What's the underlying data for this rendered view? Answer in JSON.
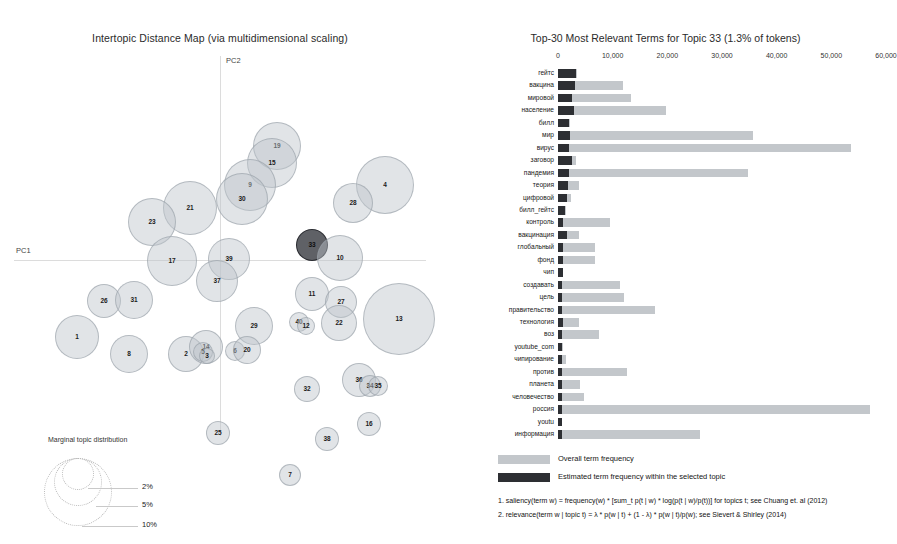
{
  "left": {
    "title": "Intertopic Distance Map (via multidimensional scaling)",
    "axis": {
      "x_label": "PC1",
      "y_label": "PC2"
    },
    "marginal_legend": {
      "title": "Marginal topic distribution",
      "ticks": [
        "2%",
        "5%",
        "10%"
      ]
    },
    "topics": [
      {
        "id": "19",
        "x": 263,
        "y": 90,
        "r": 24
      },
      {
        "id": "15",
        "x": 258,
        "y": 107,
        "r": 25
      },
      {
        "id": "9",
        "x": 236,
        "y": 129,
        "r": 26
      },
      {
        "id": "30",
        "x": 228,
        "y": 143,
        "r": 26
      },
      {
        "id": "4",
        "x": 371,
        "y": 129,
        "r": 29
      },
      {
        "id": "28",
        "x": 339,
        "y": 147,
        "r": 20
      },
      {
        "id": "21",
        "x": 176,
        "y": 152,
        "r": 27
      },
      {
        "id": "23",
        "x": 138,
        "y": 166,
        "r": 24
      },
      {
        "id": "17",
        "x": 158,
        "y": 205,
        "r": 25
      },
      {
        "id": "39",
        "x": 215,
        "y": 203,
        "r": 21
      },
      {
        "id": "37",
        "x": 203,
        "y": 225,
        "r": 21
      },
      {
        "id": "33",
        "x": 298,
        "y": 189,
        "r": 16
      },
      {
        "id": "10",
        "x": 326,
        "y": 202,
        "r": 23
      },
      {
        "id": "11",
        "x": 298,
        "y": 238,
        "r": 17
      },
      {
        "id": "27",
        "x": 327,
        "y": 246,
        "r": 16
      },
      {
        "id": "13",
        "x": 385,
        "y": 263,
        "r": 36
      },
      {
        "id": "26",
        "x": 90,
        "y": 245,
        "r": 17
      },
      {
        "id": "31",
        "x": 120,
        "y": 244,
        "r": 19
      },
      {
        "id": "1",
        "x": 63,
        "y": 281,
        "r": 22
      },
      {
        "id": "8",
        "x": 115,
        "y": 298,
        "r": 19
      },
      {
        "id": "2",
        "x": 172,
        "y": 298,
        "r": 18
      },
      {
        "id": "14",
        "x": 192,
        "y": 291,
        "r": 17
      },
      {
        "id": "5",
        "x": 189,
        "y": 296,
        "r": 10
      },
      {
        "id": "3",
        "x": 193,
        "y": 300,
        "r": 8
      },
      {
        "id": "40",
        "x": 285,
        "y": 266,
        "r": 10
      },
      {
        "id": "12",
        "x": 292,
        "y": 270,
        "r": 9
      },
      {
        "id": "29",
        "x": 240,
        "y": 270,
        "r": 19
      },
      {
        "id": "6",
        "x": 221,
        "y": 295,
        "r": 10
      },
      {
        "id": "20",
        "x": 233,
        "y": 294,
        "r": 14
      },
      {
        "id": "22",
        "x": 325,
        "y": 267,
        "r": 18
      },
      {
        "id": "32",
        "x": 293,
        "y": 333,
        "r": 13
      },
      {
        "id": "36",
        "x": 345,
        "y": 324,
        "r": 17
      },
      {
        "id": "34",
        "x": 356,
        "y": 330,
        "r": 11
      },
      {
        "id": "35",
        "x": 364,
        "y": 330,
        "r": 10
      },
      {
        "id": "16",
        "x": 355,
        "y": 368,
        "r": 12
      },
      {
        "id": "38",
        "x": 313,
        "y": 383,
        "r": 12
      },
      {
        "id": "25",
        "x": 204,
        "y": 377,
        "r": 12
      },
      {
        "id": "7",
        "x": 276,
        "y": 419,
        "r": 11
      },
      {
        "id": "18",
        "x": 355,
        "y": 368,
        "r": 0
      }
    ],
    "selected_topic": "33"
  },
  "right": {
    "title": "Top-30 Most Relevant Terms for Topic 33 (1.3% of tokens)",
    "legend": {
      "overall": "Overall term frequency",
      "topic": "Estimated term frequency within the selected topic"
    },
    "footnotes": [
      "1. saliency(term w) = frequency(w) * [sum_t p(t | w) * log(p(t | w)/p(t))] for topics t; see Chuang et. al (2012)",
      "2. relevance(term w | topic t) = λ * p(w | t) + (1 - λ) * p(w | t)/p(w); see Sievert & Shirley (2014)"
    ]
  },
  "chart_data": {
    "type": "bar",
    "title": "Top-30 Most Relevant Terms for Topic 33 (1.3% of tokens)",
    "orientation": "horizontal",
    "xlabel": "",
    "ylabel": "",
    "xlim": [
      0,
      60000
    ],
    "xticks": [
      0,
      10000,
      20000,
      30000,
      40000,
      50000,
      60000
    ],
    "xtick_labels": [
      "0",
      "10,000",
      "20,000",
      "30,000",
      "40,000",
      "50,000",
      "60,000"
    ],
    "grid": false,
    "legend_position": "bottom",
    "categories": [
      "гейтс",
      "вакцина",
      "мировой",
      "население",
      "билл",
      "мир",
      "вирус",
      "заговор",
      "пандемия",
      "теория",
      "цифровой",
      "билл_гейтс",
      "контроль",
      "вакцинация",
      "глобальный",
      "фонд",
      "чип",
      "создавать",
      "цель",
      "правительство",
      "технология",
      "воз",
      "youtube_com",
      "чипирование",
      "против",
      "планета",
      "человечество",
      "россия",
      "youtu",
      "информация"
    ],
    "series": [
      {
        "name": "Overall term frequency",
        "color": "#c3c7cb",
        "values": [
          3400,
          11800,
          13300,
          19800,
          2200,
          35600,
          53600,
          3300,
          34800,
          3900,
          2300,
          1400,
          9500,
          3900,
          6800,
          6700,
          1000,
          11300,
          12000,
          17700,
          3800,
          7500,
          900,
          1500,
          12700,
          4000,
          4700,
          57000,
          800,
          26000
        ]
      },
      {
        "name": "Estimated term frequency within the selected topic",
        "color": "#2d2f33",
        "values": [
          3300,
          3100,
          2600,
          2900,
          2000,
          2200,
          2000,
          2600,
          2000,
          1900,
          1700,
          1300,
          1000,
          1600,
          1000,
          1000,
          900,
          800,
          800,
          800,
          900,
          800,
          800,
          700,
          700,
          700,
          700,
          700,
          700,
          700
        ]
      }
    ]
  }
}
